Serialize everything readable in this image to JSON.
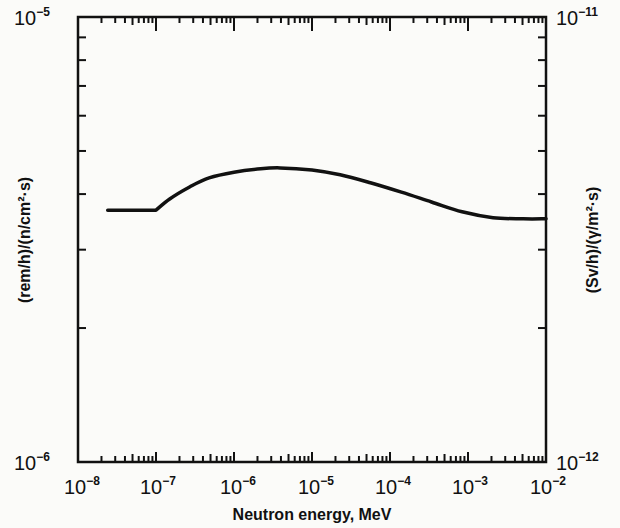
{
  "chart_data": {
    "type": "line",
    "title": "",
    "xlabel": "Neutron energy, MeV",
    "ylabel": "(rem/h)/(n/cm²·s)",
    "ylabel_right": "(Sv/h)/(γ/m²·s)",
    "xscale": "log",
    "yscale": "log",
    "xlim": [
      1e-08,
      0.01
    ],
    "ylim": [
      1e-06,
      1e-05
    ],
    "ylim_right": [
      1e-12,
      1e-11
    ],
    "grid": false,
    "legend": null,
    "x_tick_labels": [
      {
        "base": "10",
        "exp": "−8",
        "value": 1e-08
      },
      {
        "base": "10",
        "exp": "−7",
        "value": 1e-07
      },
      {
        "base": "10",
        "exp": "−6",
        "value": 1e-06
      },
      {
        "base": "10",
        "exp": "−5",
        "value": 1e-05
      },
      {
        "base": "10",
        "exp": "−4",
        "value": 0.0001
      },
      {
        "base": "10",
        "exp": "−3",
        "value": 0.001
      },
      {
        "base": "10",
        "exp": "−2",
        "value": 0.01
      }
    ],
    "y_tick_labels_left": [
      {
        "base": "10",
        "exp": "−6",
        "value": 1e-06
      },
      {
        "base": "10",
        "exp": "−5",
        "value": 1e-05
      }
    ],
    "y_tick_labels_right": [
      {
        "base": "10",
        "exp": "−12",
        "value": 1e-12
      },
      {
        "base": "10",
        "exp": "−11",
        "value": 1e-11
      }
    ],
    "series": [
      {
        "name": "Neutron flux-to-dose conversion factor",
        "x": [
          2.4e-08,
          1e-07,
          1.5e-07,
          2.7e-07,
          4.8e-07,
          1e-06,
          2.2e-06,
          3.9e-06,
          1e-05,
          2.3e-05,
          5.6e-05,
          0.00014,
          0.00034,
          0.00084,
          0.0021,
          0.0051,
          0.01
        ],
        "y": [
          3.68e-06,
          3.68e-06,
          3.9e-06,
          4.15e-06,
          4.35e-06,
          4.48e-06,
          4.56e-06,
          4.58e-06,
          4.53e-06,
          4.42e-06,
          4.24e-06,
          4.04e-06,
          3.84e-06,
          3.65e-06,
          3.54e-06,
          3.52e-06,
          3.52e-06
        ]
      }
    ]
  }
}
